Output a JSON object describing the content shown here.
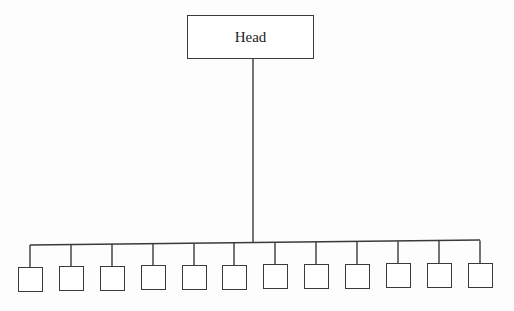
{
  "diagram": {
    "type": "org-chart",
    "root": {
      "label": "Head"
    },
    "children_count": 12,
    "children": [
      {
        "label": ""
      },
      {
        "label": ""
      },
      {
        "label": ""
      },
      {
        "label": ""
      },
      {
        "label": ""
      },
      {
        "label": ""
      },
      {
        "label": ""
      },
      {
        "label": ""
      },
      {
        "label": ""
      },
      {
        "label": ""
      },
      {
        "label": ""
      },
      {
        "label": ""
      }
    ],
    "colors": {
      "line": "#3a3a3a",
      "background": "#fdfdfd"
    }
  }
}
